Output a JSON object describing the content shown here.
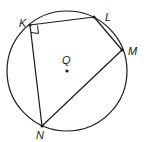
{
  "diagram": {
    "circle": {
      "center_label": "Q",
      "cx": 67,
      "cy": 71,
      "r": 60
    },
    "points": [
      {
        "label": "K",
        "x": 30,
        "y": 25,
        "label_x": 19,
        "label_y": 24
      },
      {
        "label": "L",
        "x": 94,
        "y": 17,
        "label_x": 105,
        "label_y": 18
      },
      {
        "label": "M",
        "x": 122,
        "y": 50,
        "label_x": 130,
        "label_y": 54
      },
      {
        "label": "N",
        "x": 42,
        "y": 126,
        "label_x": 36,
        "label_y": 140
      }
    ],
    "center_point": {
      "label": "Q",
      "x": 67,
      "y": 71,
      "label_x": 62,
      "label_y": 64
    },
    "segments": [
      "KL",
      "LM",
      "MN",
      "NK"
    ],
    "right_angle_marker": {
      "at": "K"
    },
    "colors": {
      "stroke": "#1a1a1a",
      "background": "#ffffff"
    }
  }
}
